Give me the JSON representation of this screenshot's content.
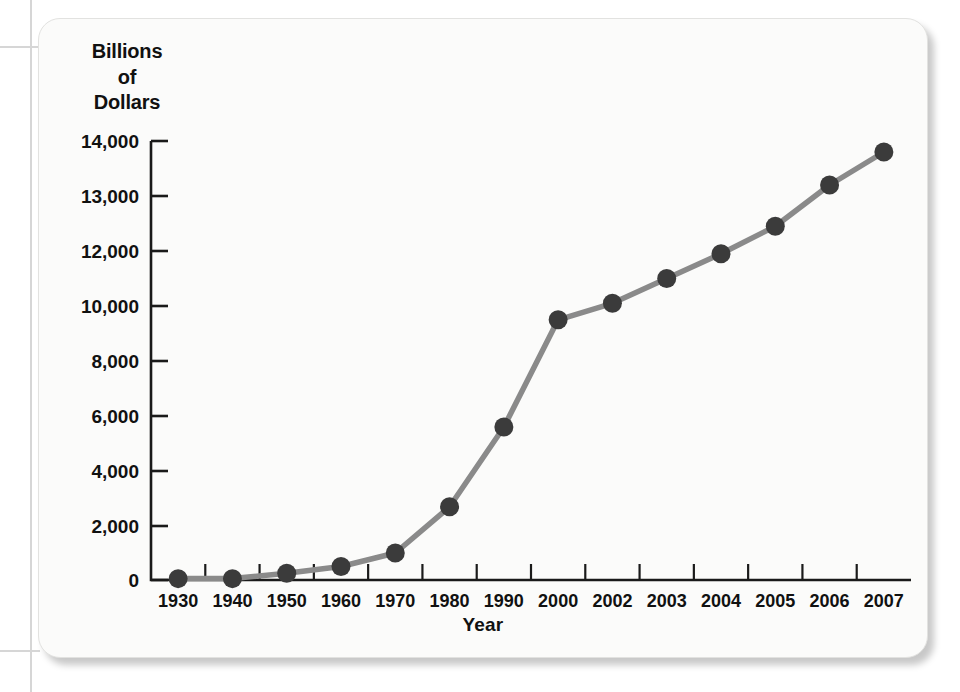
{
  "figure": {
    "y_axis_title_lines": [
      "Billions",
      "of",
      "Dollars"
    ],
    "x_axis_title": "Year",
    "line_color": "#8a8a8a",
    "marker_color": "#3b3b3b",
    "axis_color": "#1a1a1a",
    "card_background": "#fbfbfa"
  },
  "chart_data": {
    "type": "line",
    "title": "",
    "xlabel": "Year",
    "ylabel": "Billions of Dollars",
    "categories": [
      "1930",
      "1940",
      "1950",
      "1960",
      "1970",
      "1980",
      "1990",
      "2000",
      "2002",
      "2003",
      "2004",
      "2005",
      "2006",
      "2007"
    ],
    "values": [
      16,
      43,
      257,
      286,
      371,
      909,
      3233,
      5674,
      6228,
      6783,
      7379,
      7933,
      8507,
      9008
    ],
    "display_values": [
      50,
      50,
      250,
      500,
      1000,
      2700,
      5600,
      9500,
      10100,
      11000,
      11900,
      12450,
      13200,
      13800
    ],
    "y_tick_labels": [
      "14,000",
      "13,000",
      "12,000",
      "10,000",
      "8,000",
      "6,000",
      "4,000",
      "2,000",
      "0"
    ],
    "y_tick_values": [
      14000,
      13000,
      12000,
      10000,
      8000,
      6000,
      4000,
      2000,
      0
    ],
    "ylim": [
      0,
      14000
    ],
    "grid": false,
    "legend": false,
    "note": "Axis tick spacing is uniform in pixels but non-uniform in value (1,000 steps at top, 2,000 steps below 12,000)."
  }
}
